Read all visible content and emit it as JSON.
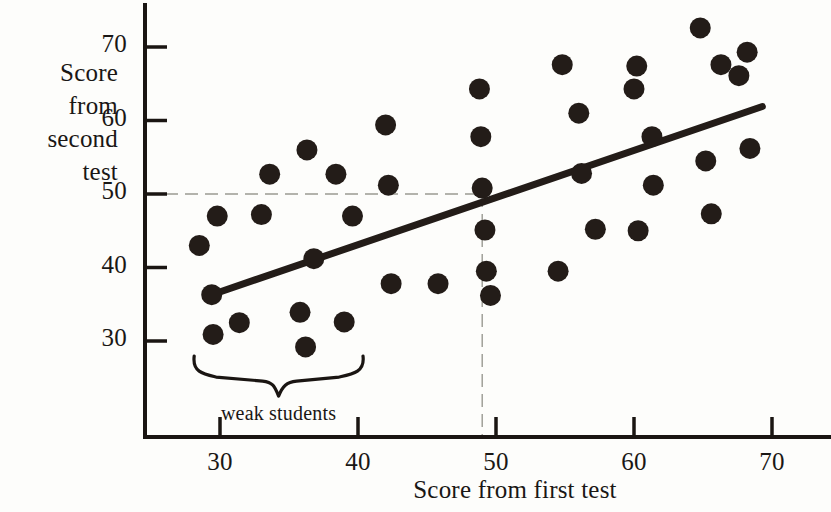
{
  "chart_data": {
    "type": "scatter",
    "title": "",
    "xlabel": "Score from first test",
    "ylabel": "Score from second test",
    "ylabel_lines": [
      "Score",
      "from",
      "second",
      "test"
    ],
    "xlim": [
      26,
      72
    ],
    "ylim": [
      24,
      74
    ],
    "xticks": [
      30,
      40,
      50,
      60,
      70
    ],
    "yticks": [
      30,
      40,
      50,
      60,
      70
    ],
    "xtick_labels": [
      "30",
      "40",
      "50",
      "60",
      "70"
    ],
    "ytick_labels": [
      "30",
      "40",
      "50",
      "60",
      "70"
    ],
    "grid": false,
    "legend": "none",
    "points": [
      {
        "x": 28.5,
        "y": 43.0
      },
      {
        "x": 29.4,
        "y": 36.3
      },
      {
        "x": 29.5,
        "y": 30.9
      },
      {
        "x": 29.8,
        "y": 47.0
      },
      {
        "x": 31.4,
        "y": 32.5
      },
      {
        "x": 33.0,
        "y": 47.2
      },
      {
        "x": 33.6,
        "y": 52.7
      },
      {
        "x": 35.8,
        "y": 33.9
      },
      {
        "x": 36.2,
        "y": 29.2
      },
      {
        "x": 36.3,
        "y": 56.0
      },
      {
        "x": 36.8,
        "y": 41.2
      },
      {
        "x": 38.4,
        "y": 52.7
      },
      {
        "x": 39.0,
        "y": 32.6
      },
      {
        "x": 39.6,
        "y": 47.0
      },
      {
        "x": 42.0,
        "y": 59.4
      },
      {
        "x": 42.2,
        "y": 51.2
      },
      {
        "x": 42.4,
        "y": 37.8
      },
      {
        "x": 45.8,
        "y": 37.8
      },
      {
        "x": 48.8,
        "y": 64.3
      },
      {
        "x": 48.9,
        "y": 57.8
      },
      {
        "x": 49.0,
        "y": 50.8
      },
      {
        "x": 49.2,
        "y": 45.1
      },
      {
        "x": 49.3,
        "y": 39.5
      },
      {
        "x": 49.6,
        "y": 36.2
      },
      {
        "x": 54.5,
        "y": 39.5
      },
      {
        "x": 54.8,
        "y": 67.6
      },
      {
        "x": 56.0,
        "y": 61.0
      },
      {
        "x": 56.2,
        "y": 52.8
      },
      {
        "x": 57.2,
        "y": 45.2
      },
      {
        "x": 60.0,
        "y": 64.3
      },
      {
        "x": 60.2,
        "y": 67.4
      },
      {
        "x": 60.3,
        "y": 45.0
      },
      {
        "x": 61.3,
        "y": 57.8
      },
      {
        "x": 61.4,
        "y": 51.2
      },
      {
        "x": 64.8,
        "y": 72.6
      },
      {
        "x": 65.2,
        "y": 54.5
      },
      {
        "x": 65.6,
        "y": 47.3
      },
      {
        "x": 66.3,
        "y": 67.6
      },
      {
        "x": 67.6,
        "y": 66.1
      },
      {
        "x": 68.2,
        "y": 69.3
      },
      {
        "x": 68.4,
        "y": 56.2
      }
    ],
    "trend_line": {
      "x_start": 29.4,
      "y_start": 36.3,
      "x_end": 69.3,
      "y_end": 61.9
    },
    "reference_lines": {
      "horizontal_y": 50.0,
      "horizontal_x_end": 49.0,
      "vertical_x": 49.0,
      "vertical_y_top": 50.0,
      "style": "dashed"
    },
    "annotations": [
      {
        "text": "weak students",
        "type": "brace",
        "x_range": [
          29.0,
          40.0
        ],
        "y": 27.0
      }
    ],
    "colors": {
      "point": "#231c18",
      "axis": "#1a1512",
      "trend_line": "#231c18",
      "reference_line": "#9a9a92",
      "background": "#fdfdfb"
    }
  }
}
